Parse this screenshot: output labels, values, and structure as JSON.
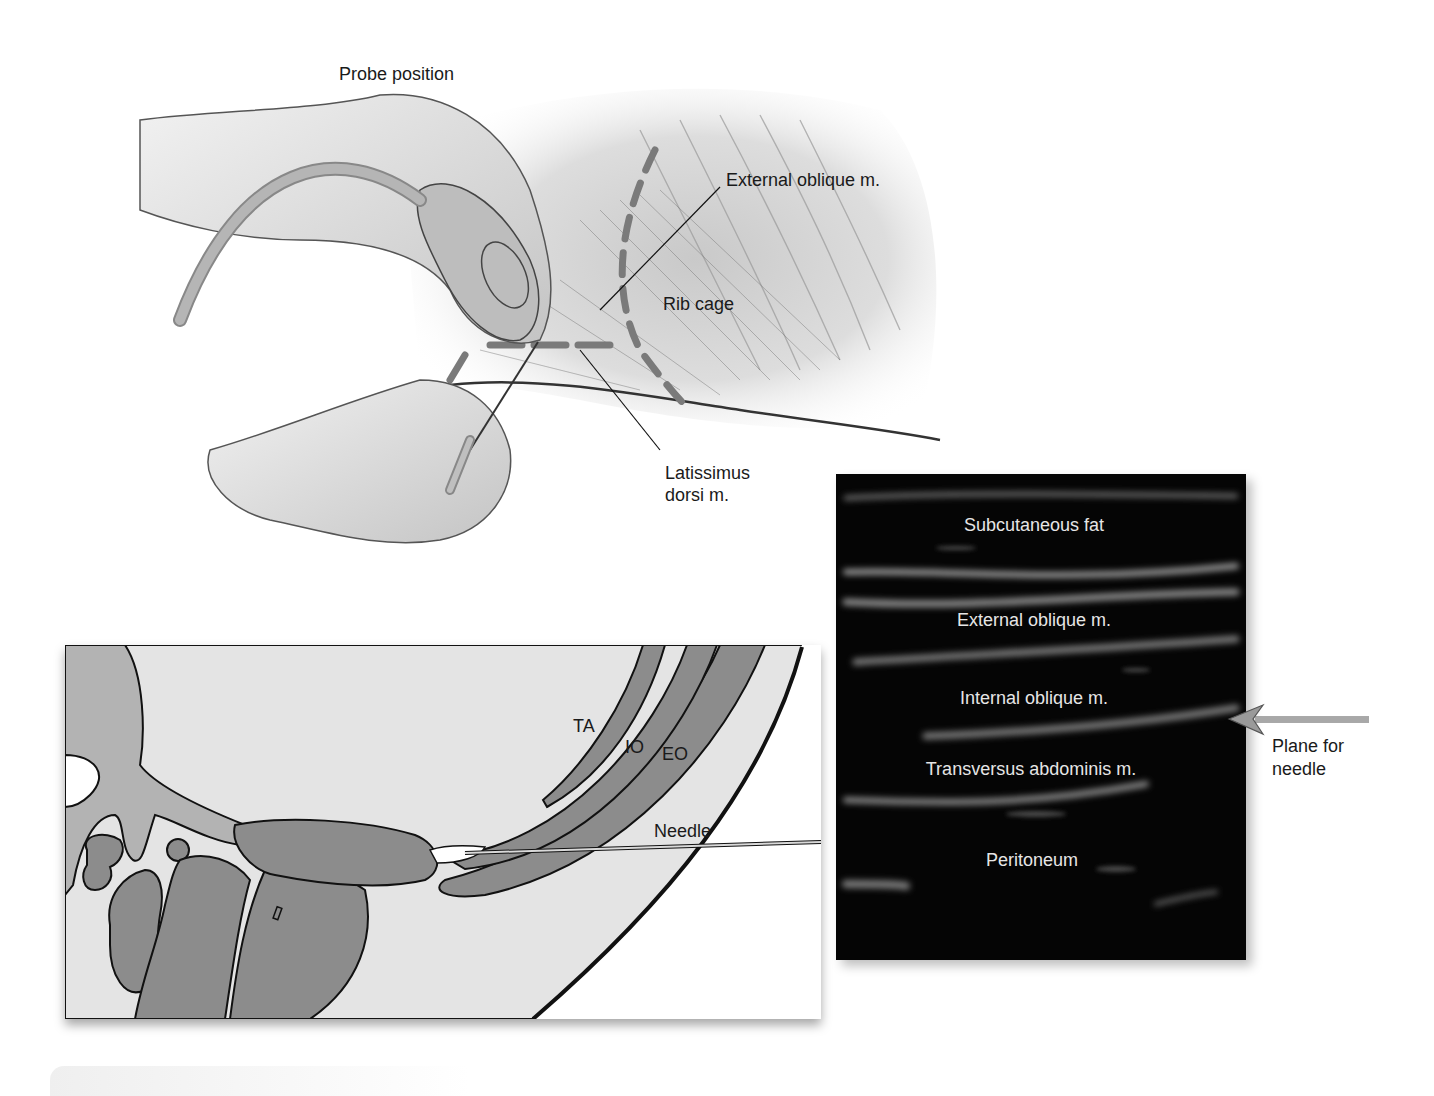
{
  "figure": {
    "top_illustration": {
      "title": "Probe position",
      "labels": {
        "external_oblique": "External oblique m.",
        "rib_cage": "Rib cage",
        "latissimus_line1": "Latissimus",
        "latissimus_line2": "dorsi m."
      }
    },
    "cross_section": {
      "labels": {
        "ta": "TA",
        "io": "IO",
        "eo": "EO",
        "needle": "Needle"
      }
    },
    "ultrasound": {
      "layers": [
        "Subcutaneous fat",
        "External oblique m.",
        "Internal oblique m.",
        "Transversus abdominis m.",
        "Peritoneum"
      ]
    },
    "annotation": {
      "plane_line1": "Plane for",
      "plane_line2": "needle"
    },
    "colors": {
      "muscle_gray": "#8c8c8c",
      "tissue_light": "#e4e4e4",
      "outline": "#111111",
      "ultrasound_bg": "#050505",
      "ultrasound_text": "#e6e6e6",
      "arrow_gray": "#9a9a9a"
    }
  }
}
